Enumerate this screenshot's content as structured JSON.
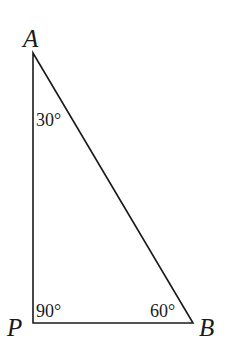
{
  "diagram": {
    "type": "right-triangle",
    "vertices": {
      "A": {
        "label": "A",
        "angle": "30°"
      },
      "P": {
        "label": "P",
        "angle": "90°"
      },
      "B": {
        "label": "B",
        "angle": "60°"
      }
    },
    "stroke_color": "#1a1a1a",
    "background": "#ffffff"
  }
}
